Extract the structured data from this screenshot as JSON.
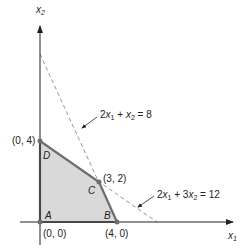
{
  "axes": {
    "x_label": "x",
    "x_sub": "1",
    "y_label": "x",
    "y_sub": "2"
  },
  "vertices": [
    {
      "name": "A",
      "coord": "(0, 0)"
    },
    {
      "name": "B",
      "coord": "(4, 0)"
    },
    {
      "name": "C",
      "coord": "(3, 2)"
    },
    {
      "name": "D",
      "coord": "(0, 4)"
    }
  ],
  "constraints": [
    {
      "label": "2x₁ + x₂ = 8",
      "a": "2",
      "v1": "x",
      "s1": "1",
      "op": " + ",
      "v2": "x",
      "s2": "2",
      "rhs": " = 8"
    },
    {
      "label": "2x₁ + 3x₂ = 12",
      "a": "2",
      "v1": "x",
      "s1": "1",
      "op": " + 3",
      "v2": "x",
      "s2": "2",
      "rhs": " = 12"
    }
  ],
  "colors": {
    "feasible_fill": "#d9d9d9",
    "boundary": "#6e6e6e",
    "axis": "#222222",
    "dashed": "#888888"
  }
}
